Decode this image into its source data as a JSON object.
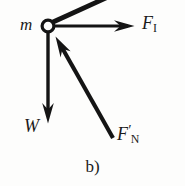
{
  "figure": {
    "kind": "free-body-diagram",
    "caption": "b)",
    "background_color": "#fdfdfc",
    "ink_color": "#141414"
  },
  "node": {
    "name": "point-mass-node",
    "shape": "hollow-circle",
    "cx": 48,
    "cy": 26,
    "r": 6,
    "stroke_width": 3.2,
    "label": "m"
  },
  "labels": {
    "mass": "m",
    "force_inertial_symbol": "F",
    "force_inertial_subscript": "I",
    "weight": "W",
    "force_normal_symbol": "F",
    "force_normal_prime": "′",
    "force_normal_subscript": "N",
    "caption": "b)"
  },
  "vectors": [
    {
      "name": "rod-link",
      "label": "",
      "description": "thick straight link from node toward upper right, runs off the top edge",
      "x1": 52,
      "y1": 22,
      "x2": 107,
      "y2": -2,
      "width": 4.6,
      "arrowhead": "none"
    },
    {
      "name": "force-inertial-vector",
      "label": "F_I",
      "direction": "right",
      "x1": 55,
      "y1": 26,
      "x2": 133,
      "y2": 26,
      "width": 3.2,
      "arrowhead": "barbed"
    },
    {
      "name": "weight-vector",
      "label": "W",
      "direction": "down",
      "x1": 48,
      "y1": 33,
      "x2": 48,
      "y2": 122,
      "width": 3.4,
      "arrowhead": "barbed"
    },
    {
      "name": "force-normal-vector",
      "label": "F'_N",
      "direction": "up-left",
      "x1": 113,
      "y1": 138,
      "x2": 56,
      "y2": 37,
      "width": 4.0,
      "arrowhead": "barbed"
    }
  ]
}
